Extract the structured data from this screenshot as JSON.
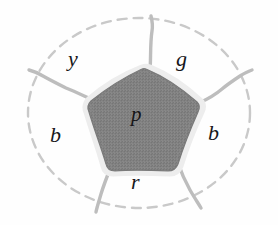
{
  "figure": {
    "background_color": "#fefefe",
    "outer_boundary": {
      "name": "dashed-ellipse",
      "style": "dashed",
      "color": "#c9c9c9"
    },
    "edge_color": "#bdbdbd",
    "central_region": {
      "id": "p",
      "label": "p",
      "fill_color": "#808080",
      "halo_color": "#ededed",
      "sides": 5
    },
    "regions": [
      {
        "id": "y",
        "label": "y",
        "position": "upper-left",
        "color_meaning": "yellow"
      },
      {
        "id": "g",
        "label": "g",
        "position": "upper-right",
        "color_meaning": "green"
      },
      {
        "id": "b-left",
        "label": "b",
        "position": "left",
        "color_meaning": "blue"
      },
      {
        "id": "b-right",
        "label": "b",
        "position": "right",
        "color_meaning": "blue"
      },
      {
        "id": "r",
        "label": "r",
        "position": "bottom",
        "color_meaning": "red"
      }
    ]
  }
}
